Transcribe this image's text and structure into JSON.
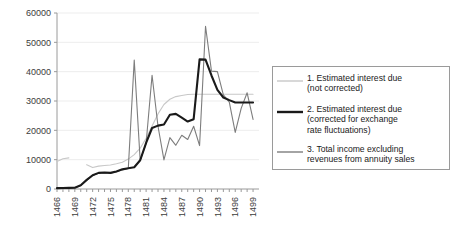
{
  "chart_data": {
    "type": "line",
    "title": "",
    "xlabel": "",
    "ylabel": "",
    "xlim": [
      1466,
      1500
    ],
    "ylim": [
      0,
      60000
    ],
    "grid": true,
    "grid_axis": "y",
    "legend_position": "right",
    "y_ticks": [
      0,
      10000,
      20000,
      30000,
      40000,
      50000,
      60000
    ],
    "y_tick_labels": [
      "0",
      "10000",
      "20000",
      "30000",
      "40000",
      "50000",
      "60000"
    ],
    "x_ticks": [
      1466,
      1467,
      1468,
      1469,
      1470,
      1471,
      1472,
      1473,
      1474,
      1475,
      1476,
      1477,
      1478,
      1479,
      1480,
      1481,
      1482,
      1483,
      1484,
      1485,
      1486,
      1487,
      1488,
      1489,
      1490,
      1491,
      1492,
      1493,
      1494,
      1495,
      1496,
      1497,
      1498,
      1499
    ],
    "x_tick_labels": [
      "1466",
      "",
      "",
      "1469",
      "",
      "",
      "1472",
      "",
      "",
      "1475",
      "",
      "",
      "1478",
      "",
      "",
      "1481",
      "",
      "",
      "1484",
      "",
      "",
      "1487",
      "",
      "",
      "1490",
      "",
      "",
      "1493",
      "",
      "",
      "1496",
      "",
      "",
      "1499"
    ],
    "x_label_interval": 3,
    "series": [
      {
        "name": "1. Estimated interest due (not corrected)",
        "legend_label_lines": [
          "1. Estimated interest due",
          "(not corrected)"
        ],
        "color": "#c8c8c8",
        "width": 1.1,
        "x": [
          1466,
          1467,
          1468,
          1471,
          1472,
          1473,
          1474,
          1475,
          1476,
          1477,
          1478,
          1479,
          1480,
          1481,
          1482,
          1483,
          1484,
          1485,
          1486,
          1487,
          1488,
          1489,
          1490,
          1491,
          1492,
          1493,
          1494,
          1495,
          1496,
          1497,
          1498,
          1499
        ],
        "y": [
          9400,
          10300,
          10600,
          8300,
          7300,
          7800,
          8000,
          8200,
          8600,
          9100,
          10200,
          11700,
          13900,
          17300,
          21500,
          25600,
          28800,
          30600,
          31500,
          31900,
          32200,
          32300,
          32300,
          32300,
          32300,
          32300,
          32300,
          32300,
          32300,
          32300,
          32300,
          32300
        ],
        "gap_after_index": 2,
        "note": "series starts 1466, short segment then gap, resumes 1471, plateaus at ~32300 from 1489 onward"
      },
      {
        "name": "2. Estimated interest due (corrected for exchange rate fluctuations)",
        "legend_label_lines": [
          "2. Estimated interest due",
          "(corrected for exchange",
          "rate fluctuations)"
        ],
        "color": "#1a1a1a",
        "width": 2.1,
        "x": [
          1466,
          1467,
          1468,
          1469,
          1470,
          1471,
          1472,
          1473,
          1474,
          1475,
          1476,
          1477,
          1478,
          1479,
          1480,
          1481,
          1482,
          1483,
          1484,
          1485,
          1486,
          1487,
          1488,
          1489,
          1490,
          1491,
          1492,
          1493,
          1494,
          1495,
          1496,
          1497,
          1498,
          1499
        ],
        "y": [
          300,
          350,
          400,
          450,
          1300,
          3100,
          4700,
          5500,
          5600,
          5500,
          6000,
          6700,
          7100,
          7400,
          9800,
          15700,
          20800,
          21600,
          22000,
          25300,
          25600,
          24300,
          23000,
          23800,
          44200,
          44100,
          38700,
          33800,
          31200,
          30300,
          29500,
          29500,
          29500,
          29500
        ]
      },
      {
        "name": "3. Total income excluding revenues from annuity sales",
        "legend_label_lines": [
          "3. Total income excluding",
          "revenues from annuity sales"
        ],
        "color": "#7d7d7d",
        "width": 1.1,
        "x": [
          1466,
          1467,
          1468,
          1469,
          1470,
          1471,
          1472,
          1473,
          1474,
          1475,
          1476,
          1477,
          1478,
          1479,
          1480,
          1481,
          1482,
          1483,
          1484,
          1485,
          1486,
          1487,
          1488,
          1489,
          1490,
          1491,
          1492,
          1493,
          1494,
          1495,
          1496,
          1497,
          1498,
          1499
        ],
        "y": [
          250,
          300,
          350,
          400,
          1200,
          3000,
          4600,
          5400,
          5500,
          5400,
          5900,
          6600,
          7000,
          7300,
          9700,
          15600,
          20700,
          21400,
          21900,
          17500,
          14900,
          18300,
          16900,
          21400,
          14800,
          29300,
          40200,
          40000,
          32100,
          29600,
          19300,
          27500,
          32800,
          23700
        ],
        "note": "series 3 tracks series 2 closely before 1481 then diverges with large volatility"
      }
    ],
    "overlay_spikes": [
      {
        "series": 3,
        "x": 1479,
        "y": 44000,
        "label": "spike to ~44000 at 1479"
      },
      {
        "series": 3,
        "x": 1482,
        "y": 38800,
        "label": "spike to ~38800 at 1482"
      },
      {
        "series": 3,
        "x": 1484,
        "y": 9900,
        "label": "trough to ~9900 at 1484"
      },
      {
        "series": 3,
        "x": 1491,
        "y": 55500,
        "label": "peak to ~55500 at 1491"
      }
    ]
  },
  "legend": {
    "entries": [
      {
        "index": "1",
        "line1": "1. Estimated interest due",
        "line2": "(not corrected)",
        "line3": ""
      },
      {
        "index": "2",
        "line1": "2. Estimated interest due",
        "line2": "(corrected for exchange",
        "line3": "rate fluctuations)"
      },
      {
        "index": "3",
        "line1": "3. Total income excluding",
        "line2": "revenues from annuity sales",
        "line3": ""
      }
    ]
  },
  "colors": {
    "series1": "#c8c8c8",
    "series2": "#1a1a1a",
    "series3": "#7d7d7d",
    "axis": "#9a9a9a",
    "grid": "#ededed",
    "text": "#3c3c3c",
    "background": "#ffffff"
  }
}
